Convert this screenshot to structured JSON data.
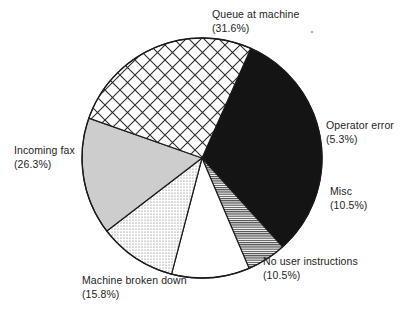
{
  "chart_data": {
    "type": "pie",
    "title": "",
    "subtitle": "",
    "xlabel": "",
    "ylabel": "",
    "legend_position": "none",
    "grid": false,
    "units": "percent",
    "total_percent": 100.0,
    "categories": [
      "Queue at machine",
      "Operator error",
      "Misc",
      "No user instructions",
      "Machine broken down",
      "Incoming fax"
    ],
    "values": [
      31.6,
      5.3,
      10.5,
      10.5,
      15.8,
      26.3
    ],
    "slices": [
      {
        "label": "Queue at machine",
        "percent": 31.6,
        "percent_text": "(31.6%)",
        "fill": "solid-black",
        "color": "#141414",
        "start_angle": -66.0,
        "end_angle": 47.8
      },
      {
        "label": "Operator error",
        "percent": 5.3,
        "percent_text": "(5.3%)",
        "fill": "fine-horizontal-hatch",
        "color": "#9a9a9a",
        "start_angle": 47.8,
        "end_angle": 66.9
      },
      {
        "label": "Misc",
        "percent": 10.5,
        "percent_text": "(10.5%)",
        "fill": "white",
        "color": "#ffffff",
        "start_angle": 66.9,
        "end_angle": 104.7
      },
      {
        "label": "No user instructions",
        "percent": 10.5,
        "percent_text": "(10.5%)",
        "fill": "fine-dot-stipple",
        "color": "#e2e2e2",
        "start_angle": 104.7,
        "end_angle": 142.5
      },
      {
        "label": "Machine broken down",
        "percent": 15.8,
        "percent_text": "(15.8%)",
        "fill": "solid-light-gray",
        "color": "#cdcdcd",
        "start_angle": 142.5,
        "end_angle": 199.4
      },
      {
        "label": "Incoming fax",
        "percent": 26.3,
        "percent_text": "(26.3%)",
        "fill": "diagonal-crosshatch",
        "color": "#ffffff",
        "start_angle": 199.4,
        "end_angle": 294.0
      }
    ],
    "geometry": {
      "center_x": 202,
      "center_y": 158,
      "radius": 120,
      "outline_color": "#1a1a1a"
    }
  },
  "labels": {
    "queue_at_machine": {
      "name": "Queue at machine",
      "percent": "(31.6%)"
    },
    "operator_error": {
      "name": "Operator error",
      "percent": "(5.3%)"
    },
    "misc": {
      "name": "Misc",
      "percent": "(10.5%)"
    },
    "no_user_instructions": {
      "name": "No user instructions",
      "percent": "(10.5%)"
    },
    "machine_broken_down": {
      "name": "Machine broken down",
      "percent": "(15.8%)"
    },
    "incoming_fax": {
      "name": "Incoming fax",
      "percent": "(26.3%)"
    }
  }
}
